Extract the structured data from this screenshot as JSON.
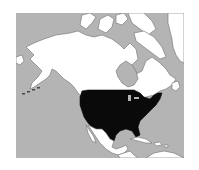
{
  "map": {
    "type": "locator-map",
    "region": "North America",
    "highlighted": "United States",
    "colors": {
      "ocean": "#b4b4b4",
      "land": "#ffffff",
      "highlight": "#0a0a0a",
      "coast": "#6e6e6e",
      "page": "#ffffff"
    },
    "features": [
      {
        "name": "Alaska",
        "fill": "land"
      },
      {
        "name": "Canada",
        "fill": "land"
      },
      {
        "name": "Greenland",
        "fill": "land"
      },
      {
        "name": "Arctic Archipelago",
        "fill": "land"
      },
      {
        "name": "Hudson Bay",
        "fill": "ocean"
      },
      {
        "name": "Contiguous United States",
        "fill": "highlight"
      },
      {
        "name": "Mexico",
        "fill": "land"
      },
      {
        "name": "Central America",
        "fill": "land"
      },
      {
        "name": "Caribbean Islands",
        "fill": "land"
      },
      {
        "name": "South America (north coast)",
        "fill": "land"
      }
    ]
  }
}
